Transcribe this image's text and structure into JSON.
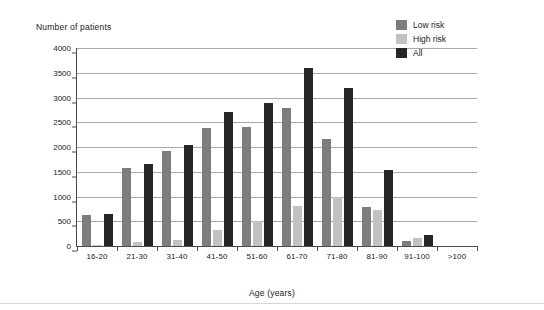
{
  "chart_data": {
    "type": "bar",
    "title": "",
    "ylabel": "Number of patients",
    "xlabel": "Age (years)",
    "categories": [
      "16-20",
      "21-30",
      "31-40",
      "41-50",
      "51-60",
      "61-70",
      "71-80",
      "81-90",
      "91-100",
      ">100"
    ],
    "ylim": [
      0,
      4000
    ],
    "yticks": [
      0,
      500,
      1000,
      1500,
      2000,
      2500,
      3000,
      3500,
      4000
    ],
    "grid": true,
    "legend_position": "top-right",
    "series": [
      {
        "name": "Low risk",
        "color": "#7d7d7d",
        "values": [
          620,
          1580,
          1910,
          2380,
          2410,
          2790,
          2160,
          790,
          110,
          0
        ]
      },
      {
        "name": "High risk",
        "color": "#c2c2c2",
        "values": [
          30,
          90,
          130,
          330,
          500,
          810,
          1000,
          730,
          160,
          0
        ]
      },
      {
        "name": "All",
        "color": "#262626",
        "values": [
          650,
          1660,
          2050,
          2700,
          2890,
          3590,
          3200,
          1540,
          230,
          0
        ]
      }
    ]
  },
  "legend": {
    "items": [
      {
        "label": "Low risk",
        "color": "#7d7d7d"
      },
      {
        "label": "High risk",
        "color": "#c2c2c2"
      },
      {
        "label": "All",
        "color": "#262626"
      }
    ]
  }
}
